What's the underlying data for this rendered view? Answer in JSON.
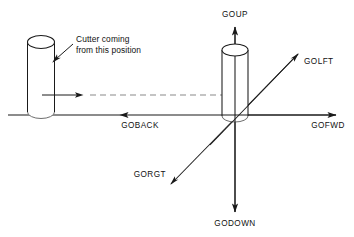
{
  "diagram": {
    "colors": {
      "line": "#1a1a1a",
      "dashed_line": "#8a8a8a",
      "cylinder_outline": "#1a1a1a",
      "text": "#111111",
      "background": "#ffffff"
    },
    "origin": {
      "x": 234,
      "y": 115
    },
    "axis_labels": [
      {
        "id": "goup",
        "text": "GOUP",
        "x": 235,
        "y": 17,
        "anchor": "middle",
        "direction": "up"
      },
      {
        "id": "godown",
        "text": "GODOWN",
        "x": 235,
        "y": 226,
        "anchor": "middle",
        "direction": "down"
      },
      {
        "id": "gofwd",
        "text": "GOFWD",
        "x": 328,
        "y": 128,
        "anchor": "middle",
        "direction": "right"
      },
      {
        "id": "goback",
        "text": "GOBACK",
        "x": 140,
        "y": 128,
        "anchor": "middle",
        "direction": "left"
      },
      {
        "id": "golft",
        "text": "GOLFT",
        "x": 304,
        "y": 64,
        "anchor": "start",
        "direction": "up-right"
      },
      {
        "id": "gorgt",
        "text": "GORGT",
        "x": 166,
        "y": 177,
        "anchor": "end",
        "direction": "down-left"
      }
    ],
    "callout": {
      "id": "cutter-callout",
      "line1": "Cutter coming",
      "line2": "from this position",
      "line1_x": 76,
      "line1_y": 42,
      "line2_x": 76,
      "line2_y": 53
    },
    "cylinders": [
      {
        "id": "cutter-start-position",
        "cx": 41,
        "top_y": 42,
        "bottom_y": 112,
        "rx": 13.5,
        "ry": 6.5
      },
      {
        "id": "cutter-origin-position",
        "cx": 235,
        "top_y": 50,
        "bottom_y": 116,
        "rx": 13,
        "ry": 6
      }
    ],
    "trajectory": {
      "id": "cutter-travel-path",
      "y": 95,
      "solid_from_x": 42,
      "arrow_tip_x": 83,
      "dashed_from_x": 90,
      "dashed_to_x": 236,
      "style": "dashed"
    },
    "baseline": {
      "from_x": 8,
      "to_x": 336,
      "y": 115
    }
  }
}
